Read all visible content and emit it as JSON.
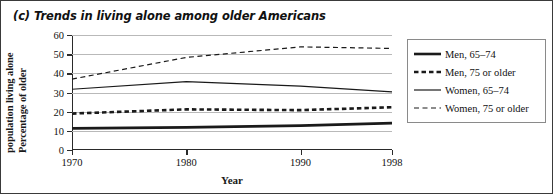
{
  "figure": {
    "title": "(c) Trends in living alone among older Americans",
    "ylabel_line1": "Percentage of older",
    "ylabel_line2": "population living alone",
    "xlabel": "Year"
  },
  "chart_data": {
    "type": "line",
    "title": "(c) Trends in living alone among older Americans",
    "xlabel": "Year",
    "ylabel": "Percentage of older population living alone",
    "categories": [
      "1970",
      "1980",
      "1990",
      "1998"
    ],
    "x": [
      1970,
      1980,
      1990,
      1998
    ],
    "xlim": [
      1970,
      1998
    ],
    "ylim": [
      0,
      60
    ],
    "yticks": [
      0,
      10,
      20,
      30,
      40,
      50,
      60
    ],
    "xticks": [
      1970,
      1980,
      1990,
      1998
    ],
    "grid": "horizontal",
    "legend_position": "right",
    "series": [
      {
        "name": "Men, 65–74",
        "values": [
          11.3,
          11.8,
          12.7,
          14.0
        ],
        "style": "solid",
        "width": "thick",
        "color": "#1a1a1a"
      },
      {
        "name": "Men, 75 or older",
        "values": [
          19.0,
          21.2,
          20.8,
          22.3
        ],
        "style": "dashed",
        "width": "thick",
        "color": "#1a1a1a"
      },
      {
        "name": "Women, 65–74",
        "values": [
          31.7,
          35.7,
          33.3,
          30.3
        ],
        "style": "solid",
        "width": "thin",
        "color": "#1a1a1a"
      },
      {
        "name": "Women, 75 or older",
        "values": [
          37.0,
          48.3,
          53.8,
          53.0
        ],
        "style": "dashed",
        "width": "thin",
        "color": "#1a1a1a"
      }
    ]
  }
}
